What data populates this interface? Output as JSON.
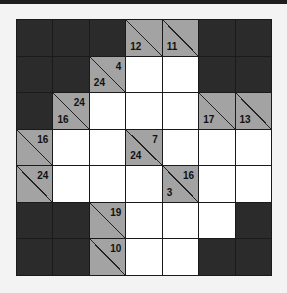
{
  "puzzle": {
    "type": "kakuro",
    "rows": 7,
    "cols": 7,
    "colors": {
      "dark": "#2b2b2b",
      "clue": "#a3a3a3",
      "white": "#ffffff",
      "line": "#1a1a1a"
    },
    "grid": [
      [
        {
          "t": "dark"
        },
        {
          "t": "dark"
        },
        {
          "t": "dark"
        },
        {
          "t": "clue",
          "down": "12",
          "right": ""
        },
        {
          "t": "clue",
          "down": "11",
          "right": ""
        },
        {
          "t": "dark"
        },
        {
          "t": "dark"
        }
      ],
      [
        {
          "t": "dark"
        },
        {
          "t": "dark"
        },
        {
          "t": "clue",
          "down": "24",
          "right": "4"
        },
        {
          "t": "white"
        },
        {
          "t": "white"
        },
        {
          "t": "dark"
        },
        {
          "t": "dark"
        }
      ],
      [
        {
          "t": "dark"
        },
        {
          "t": "clue",
          "down": "16",
          "right": "24"
        },
        {
          "t": "white"
        },
        {
          "t": "white"
        },
        {
          "t": "white"
        },
        {
          "t": "clue",
          "down": "17",
          "right": ""
        },
        {
          "t": "clue",
          "down": "13",
          "right": ""
        }
      ],
      [
        {
          "t": "clue",
          "down": "",
          "right": "16"
        },
        {
          "t": "white"
        },
        {
          "t": "white"
        },
        {
          "t": "clue",
          "down": "24",
          "right": "7"
        },
        {
          "t": "white"
        },
        {
          "t": "white"
        },
        {
          "t": "white"
        }
      ],
      [
        {
          "t": "clue",
          "down": "",
          "right": "24"
        },
        {
          "t": "white"
        },
        {
          "t": "white"
        },
        {
          "t": "white"
        },
        {
          "t": "clue",
          "down": "3",
          "right": "16"
        },
        {
          "t": "white"
        },
        {
          "t": "white"
        }
      ],
      [
        {
          "t": "dark"
        },
        {
          "t": "dark"
        },
        {
          "t": "clue",
          "down": "",
          "right": "19"
        },
        {
          "t": "white"
        },
        {
          "t": "white"
        },
        {
          "t": "white"
        },
        {
          "t": "dark"
        }
      ],
      [
        {
          "t": "dark"
        },
        {
          "t": "dark"
        },
        {
          "t": "clue",
          "down": "",
          "right": "10"
        },
        {
          "t": "white"
        },
        {
          "t": "white"
        },
        {
          "t": "dark"
        },
        {
          "t": "dark"
        }
      ]
    ]
  }
}
